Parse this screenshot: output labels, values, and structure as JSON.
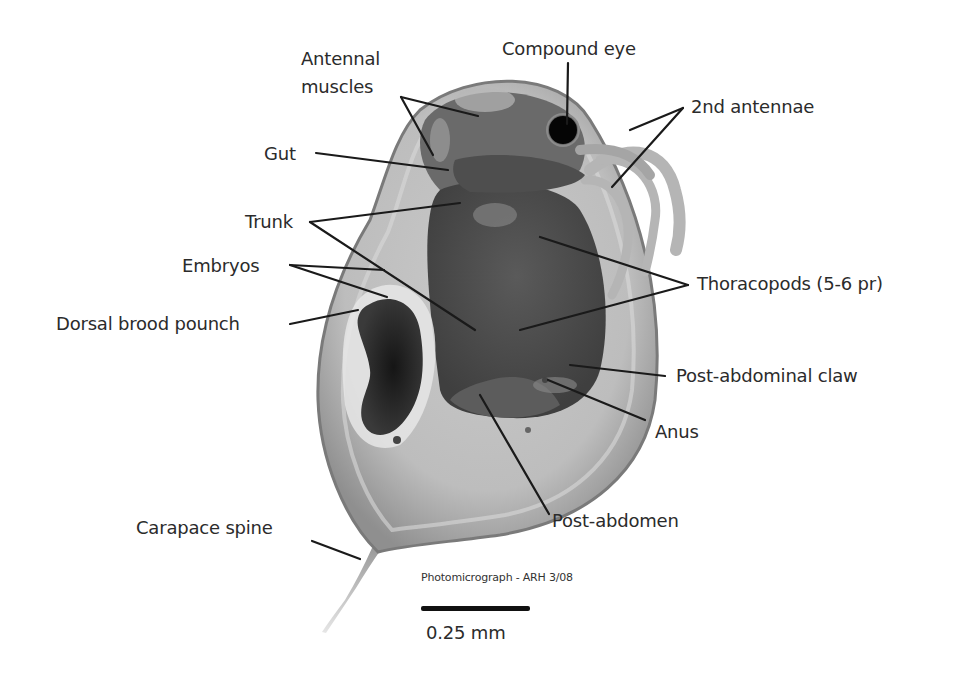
{
  "figure": {
    "labels": [
      {
        "id": "antennal-muscles",
        "text_line1": "Antennal",
        "text_line2": "muscles"
      },
      {
        "id": "compound-eye",
        "text": "Compound eye"
      },
      {
        "id": "2nd-antennae",
        "text": "2nd antennae"
      },
      {
        "id": "gut",
        "text": "Gut"
      },
      {
        "id": "trunk",
        "text": "Trunk"
      },
      {
        "id": "thoracopods",
        "text": "Thoracopods (5-6 pr)"
      },
      {
        "id": "embryos",
        "text": "Embryos"
      },
      {
        "id": "post-abdominal-claw",
        "text": "Post-abdominal claw"
      },
      {
        "id": "dorsal-brood-pouch",
        "text": "Dorsal brood pounch"
      },
      {
        "id": "anus",
        "text": "Anus"
      },
      {
        "id": "carapace-spine",
        "text": "Carapace spine"
      },
      {
        "id": "post-abdomen",
        "text": "Post-abdomen"
      }
    ],
    "credit": "Photomicrograph - ARH 3/08",
    "scale_bar": {
      "label": "0.25 mm"
    }
  }
}
